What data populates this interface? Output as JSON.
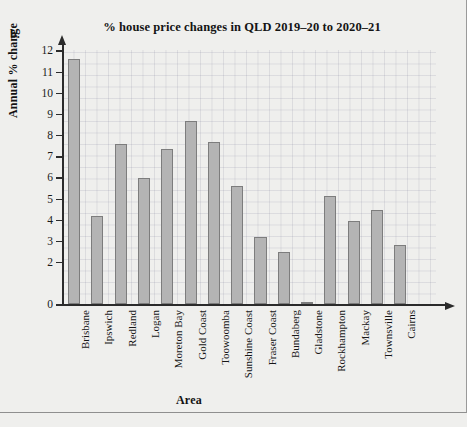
{
  "part_label": "b.",
  "chart_data": {
    "type": "bar",
    "title": "% house price changes in QLD 2019–20 to 2020–21",
    "xlabel": "Area",
    "ylabel": "Annual % change",
    "ylim": [
      0,
      12
    ],
    "ytick_labels": [
      "0",
      "2",
      "3",
      "4",
      "5",
      "6",
      "7",
      "8",
      "9",
      "10",
      "11",
      "12"
    ],
    "ytick_values": [
      0,
      2,
      3,
      4,
      5,
      6,
      7,
      8,
      9,
      10,
      11,
      12
    ],
    "grid": true,
    "legend": "none",
    "categories": [
      "Brisbane",
      "Ipswich",
      "Redland",
      "Logan",
      "Moreton Bay",
      "Gold Coast",
      "Toowoomba",
      "Sunshine Coast",
      "Fraser Coast",
      "Bundaberg",
      "Gladstone",
      "Rockhampton",
      "Mackay",
      "Townsville",
      "Cairns"
    ],
    "values": [
      11.6,
      4.2,
      7.6,
      5.95,
      7.35,
      8.65,
      7.65,
      5.6,
      3.2,
      2.5,
      0.05,
      5.1,
      3.95,
      4.45,
      2.8
    ],
    "bar_color": "#b4b4b4",
    "bar_edge_color": "#7d7d7d",
    "axis_color": "#2b2b2b",
    "background_color": "#efefed"
  }
}
